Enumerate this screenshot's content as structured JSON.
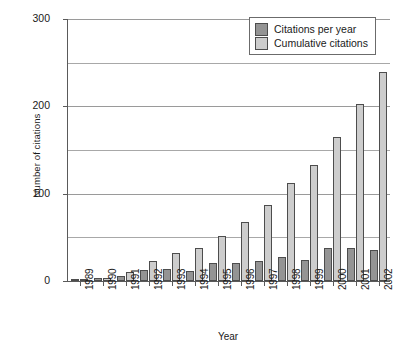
{
  "chart_data": {
    "type": "bar",
    "title": "",
    "xlabel": "Year",
    "ylabel": "Number of citations",
    "categories": [
      "1989",
      "1990",
      "1991",
      "1992",
      "1993",
      "1994",
      "1995",
      "1996",
      "1997",
      "1998",
      "1999",
      "2000",
      "2001",
      "2002"
    ],
    "series": [
      {
        "name": "Citations per year",
        "color": "#949494",
        "values": [
          1,
          3,
          6,
          13,
          14,
          11,
          21,
          21,
          23,
          28,
          24,
          38,
          38,
          36
        ]
      },
      {
        "name": "Cumulative citations",
        "color": "#cdcdcd",
        "values": [
          1,
          4,
          10,
          23,
          32,
          38,
          51,
          68,
          87,
          112,
          133,
          165,
          203,
          239
        ]
      }
    ],
    "ylim": [
      0,
      300
    ],
    "yticks": [
      0,
      100,
      200,
      300
    ],
    "ytick_labels": [
      "0",
      "100",
      "200",
      "300"
    ],
    "minor_gridlines": [
      50,
      150,
      250
    ],
    "grid": true,
    "legend_position": "top-right"
  }
}
